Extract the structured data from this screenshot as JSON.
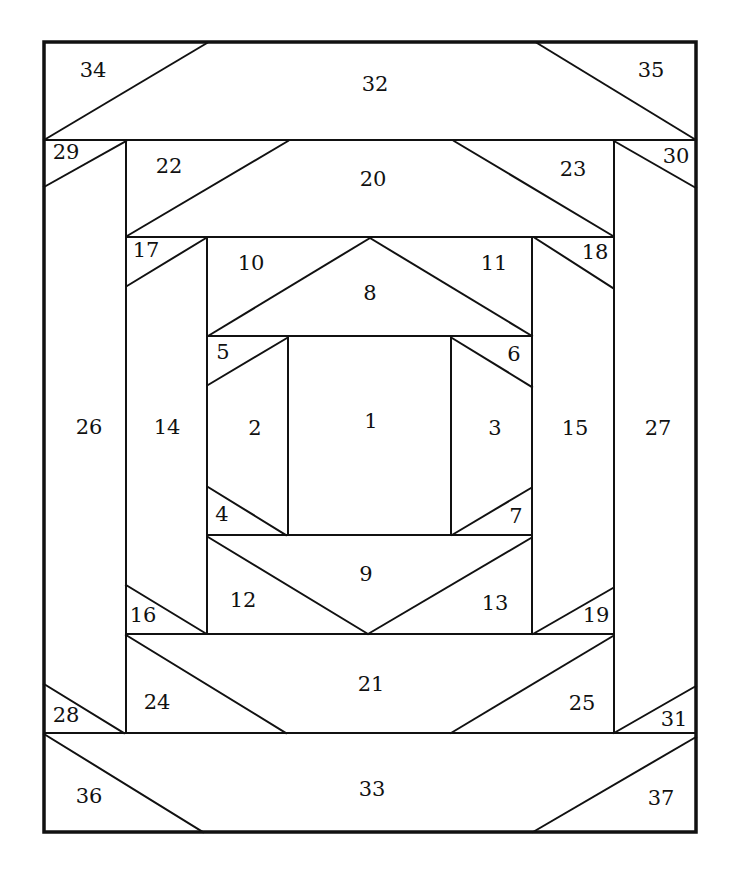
{
  "diagram": {
    "title": "",
    "type": "foundation paper piecing quilt block (log-cabin / pineapple style)",
    "stroke_color": "#111111",
    "background": "#ffffff",
    "outer_border": {
      "x1": 44,
      "y1": 42,
      "x2": 696,
      "y2": 832
    },
    "lines": [
      [
        44,
        140,
        696,
        140
      ],
      [
        44,
        733,
        696,
        733
      ],
      [
        126,
        140,
        126,
        733
      ],
      [
        614,
        140,
        614,
        733
      ],
      [
        126,
        237,
        614,
        237
      ],
      [
        126,
        634,
        614,
        634
      ],
      [
        207,
        237,
        207,
        634
      ],
      [
        532,
        237,
        532,
        634
      ],
      [
        207,
        336,
        532,
        336
      ],
      [
        207,
        535,
        532,
        535
      ],
      [
        288,
        336,
        288,
        535
      ],
      [
        451,
        336,
        451,
        535
      ],
      [
        44,
        140,
        207,
        43
      ],
      [
        537,
        43,
        696,
        140
      ],
      [
        44,
        734,
        203,
        832
      ],
      [
        533,
        832,
        696,
        737
      ],
      [
        44,
        187,
        126,
        141
      ],
      [
        614,
        141,
        696,
        188
      ],
      [
        44,
        684,
        124,
        733
      ],
      [
        614,
        733,
        696,
        686
      ],
      [
        127,
        236,
        288,
        141
      ],
      [
        454,
        141,
        613,
        236
      ],
      [
        126,
        635,
        286,
        733
      ],
      [
        451,
        733,
        613,
        636
      ],
      [
        127,
        286,
        206,
        238
      ],
      [
        535,
        238,
        613,
        288
      ],
      [
        126,
        585,
        205,
        633
      ],
      [
        533,
        634,
        613,
        588
      ],
      [
        208,
        336,
        370,
        238
      ],
      [
        370,
        238,
        532,
        336
      ],
      [
        208,
        537,
        368,
        634
      ],
      [
        368,
        634,
        531,
        538
      ],
      [
        208,
        385,
        287,
        338
      ],
      [
        452,
        338,
        532,
        387
      ],
      [
        208,
        487,
        286,
        535
      ],
      [
        452,
        535,
        531,
        488
      ]
    ],
    "pieces": [
      {
        "id": "1",
        "x": 371,
        "y": 422
      },
      {
        "id": "2",
        "x": 255,
        "y": 429
      },
      {
        "id": "3",
        "x": 495,
        "y": 429
      },
      {
        "id": "4",
        "x": 222,
        "y": 515
      },
      {
        "id": "5",
        "x": 223,
        "y": 353
      },
      {
        "id": "6",
        "x": 514,
        "y": 355
      },
      {
        "id": "7",
        "x": 516,
        "y": 517
      },
      {
        "id": "8",
        "x": 370,
        "y": 294
      },
      {
        "id": "9",
        "x": 366,
        "y": 575
      },
      {
        "id": "10",
        "x": 251,
        "y": 264
      },
      {
        "id": "11",
        "x": 494,
        "y": 264
      },
      {
        "id": "12",
        "x": 243,
        "y": 601
      },
      {
        "id": "13",
        "x": 495,
        "y": 604
      },
      {
        "id": "14",
        "x": 167,
        "y": 428
      },
      {
        "id": "15",
        "x": 575,
        "y": 429
      },
      {
        "id": "16",
        "x": 143,
        "y": 616
      },
      {
        "id": "17",
        "x": 146,
        "y": 251
      },
      {
        "id": "18",
        "x": 595,
        "y": 253
      },
      {
        "id": "19",
        "x": 596,
        "y": 616
      },
      {
        "id": "20",
        "x": 373,
        "y": 180
      },
      {
        "id": "21",
        "x": 371,
        "y": 685
      },
      {
        "id": "22",
        "x": 169,
        "y": 167
      },
      {
        "id": "23",
        "x": 573,
        "y": 170
      },
      {
        "id": "24",
        "x": 157,
        "y": 703
      },
      {
        "id": "25",
        "x": 582,
        "y": 704
      },
      {
        "id": "26",
        "x": 89,
        "y": 428
      },
      {
        "id": "27",
        "x": 658,
        "y": 429
      },
      {
        "id": "28",
        "x": 66,
        "y": 716
      },
      {
        "id": "29",
        "x": 66,
        "y": 153
      },
      {
        "id": "30",
        "x": 676,
        "y": 157
      },
      {
        "id": "31",
        "x": 674,
        "y": 720
      },
      {
        "id": "32",
        "x": 375,
        "y": 85
      },
      {
        "id": "33",
        "x": 372,
        "y": 790
      },
      {
        "id": "34",
        "x": 93,
        "y": 71
      },
      {
        "id": "35",
        "x": 651,
        "y": 71
      },
      {
        "id": "36",
        "x": 89,
        "y": 797
      },
      {
        "id": "37",
        "x": 661,
        "y": 799
      }
    ]
  }
}
